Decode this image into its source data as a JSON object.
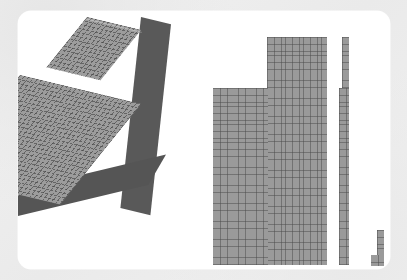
{
  "view": {
    "background_color": "#eeeeee",
    "card_color": "#ffffff",
    "card_corner_radius_px": 13
  },
  "palette": {
    "mesh_face_color": "#9a9a9a",
    "mesh_line_color": "#464646",
    "extrusion_side_color": "#595959",
    "extrusion_front_color": "#555555"
  },
  "model": {
    "title": "",
    "description": "",
    "units": ""
  },
  "parts": [
    {
      "id": "solid-block",
      "name": "3d-extruded-l-block",
      "representation": "isometric-solid",
      "face_color": "#9c9c9c",
      "side_color": "#595959",
      "mesh": {
        "cols": 26,
        "rows": 46,
        "cell_px": 4.3
      },
      "bounds_px": {
        "x": 18,
        "y": 29,
        "w": 168,
        "h": 237
      }
    },
    {
      "id": "face-top",
      "name": "flat-l-face-mesh",
      "representation": "flat-2d",
      "face_color": "#9a9a9a",
      "mesh": {
        "cols": 27,
        "rows": 54,
        "cell_px": 4.2
      },
      "bounds_px": {
        "x": 213,
        "y": 37,
        "w": 114,
        "h": 228
      }
    },
    {
      "id": "face-side-long",
      "name": "narrow-strip-mesh",
      "representation": "flat-2d",
      "face_color": "#9a9a9a",
      "mesh": {
        "cols": 2,
        "rows": 54,
        "cell_px": 4.2
      },
      "bounds_px": {
        "x": 339,
        "y": 37,
        "w": 10,
        "h": 228
      }
    },
    {
      "id": "face-corner-small",
      "name": "small-step-mesh",
      "representation": "flat-2d",
      "face_color": "#9a9a9a",
      "mesh": {
        "cols": 3,
        "rows": 8,
        "cell_px": 4.2
      },
      "bounds_px": {
        "x": 371,
        "y": 230,
        "w": 13,
        "h": 35
      }
    }
  ],
  "labels": {
    "none_visible": ""
  }
}
